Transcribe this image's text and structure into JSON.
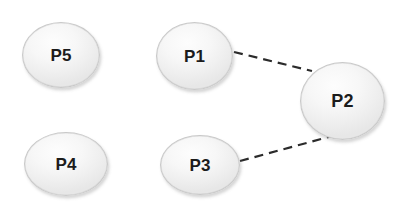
{
  "diagram": {
    "kind": "node-link-graph",
    "background_color": "#ffffff",
    "node_fill_color": "#f3f3f3",
    "node_border_color": "#c9c9c9",
    "node_label_color": "#1c1c1c",
    "edge_color": "#2b2b2b",
    "nodes": [
      {
        "id": "p5",
        "label": "P5",
        "x": 22,
        "y": 22,
        "width": 78,
        "height": 66
      },
      {
        "id": "p1",
        "label": "P1",
        "x": 156,
        "y": 22,
        "width": 77,
        "height": 68
      },
      {
        "id": "p2",
        "label": "P2",
        "x": 300,
        "y": 62,
        "width": 85,
        "height": 78
      },
      {
        "id": "p4",
        "label": "P4",
        "x": 24,
        "y": 132,
        "width": 84,
        "height": 64
      },
      {
        "id": "p3",
        "label": "P3",
        "x": 160,
        "y": 135,
        "width": 80,
        "height": 60
      }
    ],
    "edges": [
      {
        "id": "edge-p1-p2",
        "from": "p1",
        "to": "p2",
        "style": "dashed",
        "x1": 234,
        "y1": 52,
        "x2": 312,
        "y2": 71
      },
      {
        "id": "edge-p3-p2",
        "from": "p3",
        "to": "p2",
        "style": "dashed",
        "x1": 240,
        "y1": 161,
        "x2": 347,
        "y2": 132
      }
    ],
    "isolated_nodes": [
      "p5",
      "p4"
    ]
  }
}
